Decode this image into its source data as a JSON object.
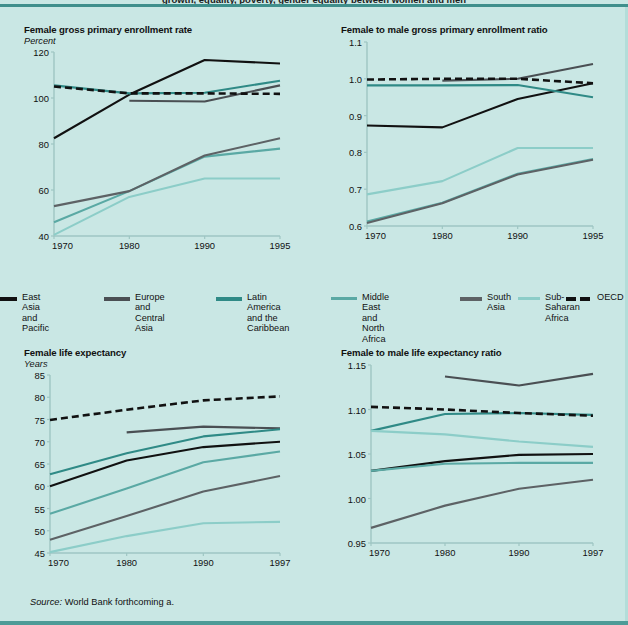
{
  "figure": {
    "top_banner_title": "growth, equality, poverty, gender equality between women and men",
    "source_prefix": "Source:",
    "source_text": "World Bank forthcoming a.",
    "background_color": "#c9e7e4",
    "rule_color": "#3f8f8c"
  },
  "legend": {
    "entries": [
      {
        "label": "East Asia\nand Pacific",
        "color": "#111111",
        "style": "solid",
        "key": "east-asia-pacific"
      },
      {
        "label": "Europe and\nCentral Asia",
        "color": "#4a4f53",
        "style": "solid",
        "key": "europe-central-asia"
      },
      {
        "label": "Latin America\nand the\nCaribbean",
        "color": "#2f8a86",
        "style": "solid",
        "key": "latin-america-caribbean"
      },
      {
        "label": "Middle East\nand North Africa",
        "color": "#5aa9a4",
        "style": "solid",
        "key": "middle-east-north-africa"
      },
      {
        "label": "South\nAsia",
        "color": "#5d6265",
        "style": "solid",
        "key": "south-asia"
      },
      {
        "label": "Sub-\nSaharan\nAfrica",
        "color": "#8ccdc8",
        "style": "solid",
        "key": "sub-saharan-africa"
      },
      {
        "label": "OECD",
        "color": "#111111",
        "style": "dashed",
        "key": "oecd"
      }
    ]
  },
  "chart_data": [
    {
      "id": "female-gross-primary-enrollment-rate",
      "type": "line",
      "title": "Female gross primary enrollment rate",
      "ylabel": "Percent",
      "xlabel": "",
      "x": [
        1970,
        1980,
        1990,
        1995
      ],
      "xticklabels": [
        "1970",
        "1980",
        "1990",
        "1995"
      ],
      "ylim": [
        40,
        120
      ],
      "yticks": [
        40,
        60,
        80,
        100,
        120
      ],
      "yticklabels": [
        "40",
        "60",
        "80",
        "100",
        "120"
      ],
      "grid": false,
      "legend_position": "below-figure",
      "series": [
        {
          "name": "East Asia and Pacific",
          "color": "#111111",
          "style": "solid",
          "x": [
            1970,
            1980,
            1990,
            1995
          ],
          "values": [
            82.5,
            101.5,
            116.5,
            115.0
          ]
        },
        {
          "name": "Europe and Central Asia",
          "color": "#4a4f53",
          "style": "solid",
          "x": [
            1980,
            1990,
            1995
          ],
          "values": [
            98.8,
            98.5,
            105.5
          ]
        },
        {
          "name": "Latin America and the Caribbean",
          "color": "#2f8a86",
          "style": "solid",
          "x": [
            1970,
            1980,
            1990,
            1995
          ],
          "values": [
            105.5,
            102.0,
            102.3,
            107.5
          ]
        },
        {
          "name": "Middle East and North Africa",
          "color": "#5aa9a4",
          "style": "solid",
          "x": [
            1970,
            1980,
            1990,
            1995
          ],
          "values": [
            46.0,
            59.5,
            74.5,
            78.0
          ]
        },
        {
          "name": "South Asia",
          "color": "#5d6265",
          "style": "solid",
          "x": [
            1970,
            1980,
            1990,
            1995
          ],
          "values": [
            53.0,
            59.5,
            75.0,
            82.5
          ]
        },
        {
          "name": "Sub-Saharan Africa",
          "color": "#8ccdc8",
          "style": "solid",
          "x": [
            1970,
            1980,
            1990,
            1995
          ],
          "values": [
            40.5,
            57.0,
            65.0,
            65.0
          ]
        },
        {
          "name": "OECD",
          "color": "#111111",
          "style": "dashed",
          "x": [
            1970,
            1980,
            1990,
            1995
          ],
          "values": [
            105.0,
            102.0,
            102.0,
            101.8
          ]
        }
      ]
    },
    {
      "id": "female-to-male-gross-primary-enrollment-ratio",
      "type": "line",
      "title": "Female to male gross primary enrollment ratio",
      "ylabel": "",
      "xlabel": "",
      "x": [
        1970,
        1980,
        1990,
        1995
      ],
      "xticklabels": [
        "1970",
        "1980",
        "1990",
        "1995"
      ],
      "ylim": [
        0.6,
        1.1
      ],
      "yticks": [
        0.6,
        0.7,
        0.8,
        0.9,
        1.0,
        1.1
      ],
      "yticklabels": [
        "0.6",
        "0.7",
        "0.8",
        "0.9",
        "1.0",
        "1.1"
      ],
      "grid": false,
      "legend_position": "above-figure",
      "series": [
        {
          "name": "East Asia and Pacific",
          "color": "#111111",
          "style": "solid",
          "x": [
            1970,
            1980,
            1990,
            1995
          ],
          "values": [
            0.873,
            0.868,
            0.945,
            0.988
          ]
        },
        {
          "name": "Europe and Central Asia",
          "color": "#4a4f53",
          "style": "solid",
          "x": [
            1980,
            1990,
            1995
          ],
          "values": [
            0.995,
            1.0,
            1.04
          ]
        },
        {
          "name": "Latin America and the Caribbean",
          "color": "#2f8a86",
          "style": "solid",
          "x": [
            1970,
            1980,
            1990,
            1995
          ],
          "values": [
            0.982,
            0.982,
            0.983,
            0.95
          ]
        },
        {
          "name": "Middle East and North Africa",
          "color": "#5aa9a4",
          "style": "solid",
          "x": [
            1970,
            1980,
            1990,
            1995
          ],
          "values": [
            0.612,
            0.663,
            0.742,
            0.782
          ]
        },
        {
          "name": "South Asia",
          "color": "#5d6265",
          "style": "solid",
          "x": [
            1970,
            1980,
            1990,
            1995
          ],
          "values": [
            0.608,
            0.662,
            0.74,
            0.78
          ]
        },
        {
          "name": "Sub-Saharan Africa",
          "color": "#8ccdc8",
          "style": "solid",
          "x": [
            1970,
            1980,
            1990,
            1995
          ],
          "values": [
            0.686,
            0.722,
            0.812,
            0.812
          ]
        },
        {
          "name": "OECD",
          "color": "#111111",
          "style": "dashed",
          "x": [
            1970,
            1980,
            1990,
            1995
          ],
          "values": [
            0.998,
            1.0,
            1.0,
            0.988
          ]
        }
      ]
    },
    {
      "id": "female-life-expectancy",
      "type": "line",
      "title": "Female life expectancy",
      "ylabel": "Years",
      "xlabel": "",
      "x": [
        1970,
        1980,
        1990,
        1997
      ],
      "xticklabels": [
        "1970",
        "1980",
        "1990",
        "1997"
      ],
      "ylim": [
        45,
        85
      ],
      "yticks": [
        45,
        50,
        55,
        60,
        65,
        70,
        75,
        80,
        85
      ],
      "yticklabels": [
        "45",
        "50",
        "55",
        "60",
        "65",
        "70",
        "75",
        "80",
        "85"
      ],
      "grid": false,
      "legend_position": "above-figure",
      "series": [
        {
          "name": "East Asia and Pacific",
          "color": "#111111",
          "style": "solid",
          "x": [
            1970,
            1980,
            1990,
            1997
          ],
          "values": [
            60.0,
            65.8,
            68.8,
            70.0
          ]
        },
        {
          "name": "Europe and Central Asia",
          "color": "#4a4f53",
          "style": "solid",
          "x": [
            1980,
            1990,
            1997
          ],
          "values": [
            72.1,
            73.4,
            73.0
          ]
        },
        {
          "name": "Latin America and the Caribbean",
          "color": "#2f8a86",
          "style": "solid",
          "x": [
            1970,
            1980,
            1990,
            1997
          ],
          "values": [
            62.7,
            67.4,
            71.2,
            72.8
          ]
        },
        {
          "name": "Middle East and North Africa",
          "color": "#5aa9a4",
          "style": "solid",
          "x": [
            1970,
            1980,
            1990,
            1997
          ],
          "values": [
            53.8,
            59.5,
            65.4,
            67.8
          ]
        },
        {
          "name": "South Asia",
          "color": "#5d6265",
          "style": "solid",
          "x": [
            1970,
            1980,
            1990,
            1997
          ],
          "values": [
            48.0,
            53.3,
            58.8,
            62.3
          ]
        },
        {
          "name": "Sub-Saharan Africa",
          "color": "#8ccdc8",
          "style": "solid",
          "x": [
            1970,
            1980,
            1990,
            1997
          ],
          "values": [
            45.2,
            48.8,
            51.7,
            52.0
          ]
        },
        {
          "name": "OECD",
          "color": "#111111",
          "style": "dashed",
          "x": [
            1970,
            1980,
            1990,
            1997
          ],
          "values": [
            74.9,
            77.2,
            79.3,
            80.2
          ]
        }
      ]
    },
    {
      "id": "female-to-male-life-expectancy-ratio",
      "type": "line",
      "title": "Female to male life expectancy ratio",
      "ylabel": "",
      "xlabel": "",
      "x": [
        1970,
        1980,
        1990,
        1997
      ],
      "xticklabels": [
        "1970",
        "1980",
        "1990",
        "1997"
      ],
      "ylim": [
        0.95,
        1.15
      ],
      "yticks": [
        0.95,
        1.0,
        1.05,
        1.1,
        1.15
      ],
      "yticklabels": [
        "0.95",
        "1.00",
        "1.05",
        "1.10",
        "1.15"
      ],
      "grid": false,
      "legend_position": "above-figure",
      "series": [
        {
          "name": "East Asia and Pacific",
          "color": "#111111",
          "style": "solid",
          "x": [
            1970,
            1980,
            1990,
            1997
          ],
          "values": [
            1.031,
            1.042,
            1.049,
            1.05
          ]
        },
        {
          "name": "Europe and Central Asia",
          "color": "#4a4f53",
          "style": "solid",
          "x": [
            1980,
            1990,
            1997
          ],
          "values": [
            1.137,
            1.127,
            1.14
          ]
        },
        {
          "name": "Latin America and the Caribbean",
          "color": "#2f8a86",
          "style": "solid",
          "x": [
            1970,
            1980,
            1990,
            1997
          ],
          "values": [
            1.076,
            1.095,
            1.096,
            1.094
          ]
        },
        {
          "name": "Middle East and North Africa",
          "color": "#5aa9a4",
          "style": "solid",
          "x": [
            1970,
            1980,
            1990,
            1997
          ],
          "values": [
            1.031,
            1.039,
            1.04,
            1.04
          ]
        },
        {
          "name": "South Asia",
          "color": "#5d6265",
          "style": "solid",
          "x": [
            1970,
            1980,
            1990,
            1997
          ],
          "values": [
            0.967,
            0.992,
            1.011,
            1.021
          ]
        },
        {
          "name": "Sub-Saharan Africa",
          "color": "#8ccdc8",
          "style": "solid",
          "x": [
            1970,
            1980,
            1990,
            1997
          ],
          "values": [
            1.076,
            1.072,
            1.064,
            1.058
          ]
        },
        {
          "name": "OECD",
          "color": "#111111",
          "style": "dashed",
          "x": [
            1970,
            1980,
            1990,
            1997
          ],
          "values": [
            1.103,
            1.1,
            1.096,
            1.093
          ]
        }
      ]
    }
  ]
}
